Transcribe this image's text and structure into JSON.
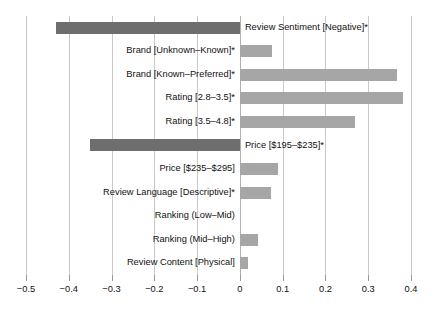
{
  "chart_data": {
    "type": "bar",
    "orientation": "horizontal",
    "title": "",
    "subtitle": "",
    "xlabel": "",
    "ylabel": "",
    "xlim": [
      -0.55,
      0.43
    ],
    "grid": true,
    "grid_axis": "x",
    "legend": false,
    "legend_position": "none",
    "xticks": [
      -0.5,
      -0.4,
      -0.3,
      -0.2,
      -0.1,
      0,
      0.1,
      0.2,
      0.3,
      0.4
    ],
    "xticklabels": [
      "−0.5",
      "−0.4",
      "−0.3",
      "−0.2",
      "−0.1",
      "0",
      "0.1",
      "0.2",
      "0.3",
      "0.4"
    ],
    "categories": [
      "Review Sentiment [Negative]*",
      "Brand [Unknown–Known]*",
      "Brand [Known–Preferred]*",
      "Rating [2.8–3.5]*",
      "Rating [3.5–4.8]*",
      "Price [$195–$235]*",
      "Price [$235–$295]",
      "Review Language [Descriptive]*",
      "Ranking (Low–Mid)",
      "Ranking (Mid–High)",
      "Review Content [Physical]"
    ],
    "values": [
      -0.43,
      0.075,
      0.367,
      0.381,
      0.269,
      -0.35,
      0.089,
      0.072,
      0.0,
      0.042,
      0.019
    ],
    "colors": {
      "negative_bar": "#6e6e6e",
      "positive_bar": "#a6a6a6",
      "gridline": "#c9c9c9",
      "zero_line": "#b0b0b0",
      "text": "#111111",
      "background": "#ffffff"
    }
  }
}
